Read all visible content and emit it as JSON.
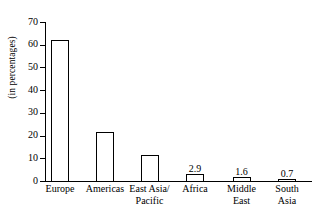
{
  "chart_data": {
    "type": "bar",
    "title": "",
    "xlabel": "",
    "ylabel": "(in percentages)",
    "ylim": [
      0,
      70
    ],
    "yticks": [
      0,
      10,
      20,
      30,
      40,
      50,
      60,
      70
    ],
    "grid": false,
    "legend": "none",
    "categories": [
      "Europe",
      "Americas",
      "East Asia/\nPacific",
      "Africa",
      "Middle\nEast",
      "South\nAsia"
    ],
    "values": [
      62,
      21.4,
      11.5,
      2.9,
      1.6,
      0.7
    ],
    "value_labels": [
      "",
      "",
      "",
      "2.9",
      "1.6",
      "0.7"
    ],
    "bar_style": {
      "fill": "#ffffff",
      "outline": "#000000"
    }
  },
  "ticks": [
    {
      "label": "70",
      "value": 70
    },
    {
      "label": "60",
      "value": 60
    },
    {
      "label": "50",
      "value": 50
    },
    {
      "label": "40",
      "value": 40
    },
    {
      "label": "30",
      "value": 30
    },
    {
      "label": "20",
      "value": 20
    },
    {
      "label": "10",
      "value": 10
    },
    {
      "label": "0",
      "value": 0
    }
  ],
  "axis": {
    "y_title": "(in percentages)"
  }
}
